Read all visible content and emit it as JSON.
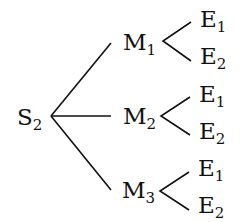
{
  "diagram": {
    "type": "tree",
    "root": {
      "label": "S",
      "subscript": "2"
    },
    "level1": [
      {
        "label": "M",
        "subscript": "1"
      },
      {
        "label": "M",
        "subscript": "2"
      },
      {
        "label": "M",
        "subscript": "3"
      }
    ],
    "leaves": [
      [
        {
          "label": "E",
          "subscript": "1"
        },
        {
          "label": "E",
          "subscript": "2"
        }
      ],
      [
        {
          "label": "E",
          "subscript": "1"
        },
        {
          "label": "E",
          "subscript": "2"
        }
      ],
      [
        {
          "label": "E",
          "subscript": "1"
        },
        {
          "label": "E",
          "subscript": "2"
        }
      ]
    ],
    "line_color": "#111111"
  }
}
